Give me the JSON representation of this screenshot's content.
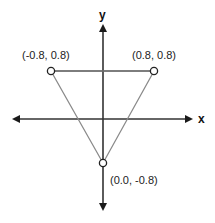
{
  "diagram": {
    "type": "coordinate-triangle",
    "axes": {
      "x_label": "x",
      "y_label": "y"
    },
    "vertices": [
      {
        "name": "top-left",
        "label": "(-0.8, 0.8)",
        "x": -0.8,
        "y": 0.8
      },
      {
        "name": "top-right",
        "label": "(0.8, 0.8)",
        "x": 0.8,
        "y": 0.8
      },
      {
        "name": "bottom",
        "label": "(0.0, -0.8)",
        "x": 0.0,
        "y": -0.8
      }
    ],
    "colors": {
      "axis": "#1a1a1a",
      "triangle_edge": "#888888",
      "vertex_fill": "#ffffff",
      "vertex_stroke": "#222222"
    }
  }
}
